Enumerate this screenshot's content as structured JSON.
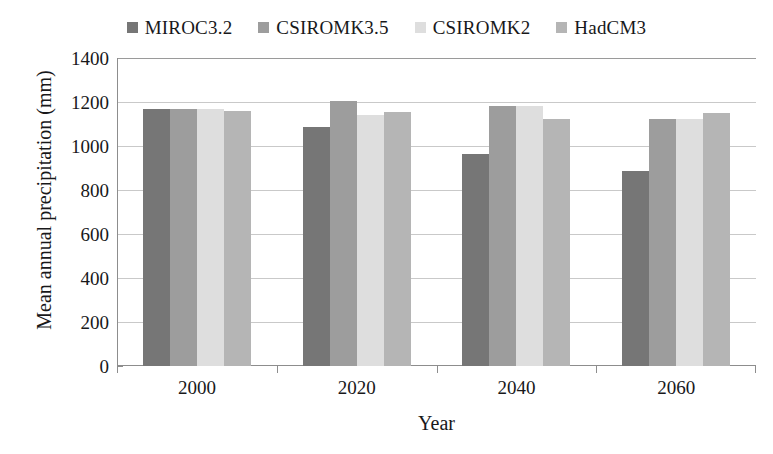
{
  "chart_data": {
    "type": "bar",
    "title": "",
    "xlabel": "Year",
    "ylabel": "Mean annual precipitation (mm)",
    "categories": [
      "2000",
      "2020",
      "2040",
      "2060"
    ],
    "ylim": [
      0,
      1400
    ],
    "ytick_step": 200,
    "yticks": [
      "1400",
      "1200",
      "1000",
      "800",
      "600",
      "400",
      "200",
      "0"
    ],
    "grid": true,
    "legend_position": "top-center",
    "series": [
      {
        "name": "MIROC3.2",
        "color": "#767676",
        "values": [
          1170,
          1085,
          965,
          885
        ]
      },
      {
        "name": "CSIROMK3.5",
        "color": "#9d9d9d",
        "values": [
          1170,
          1205,
          1180,
          1125
        ]
      },
      {
        "name": "CSIROMK2",
        "color": "#dedede",
        "values": [
          1170,
          1140,
          1180,
          1125
        ]
      },
      {
        "name": "HadCM3",
        "color": "#b5b5b5",
        "values": [
          1160,
          1155,
          1125,
          1150
        ]
      }
    ]
  }
}
